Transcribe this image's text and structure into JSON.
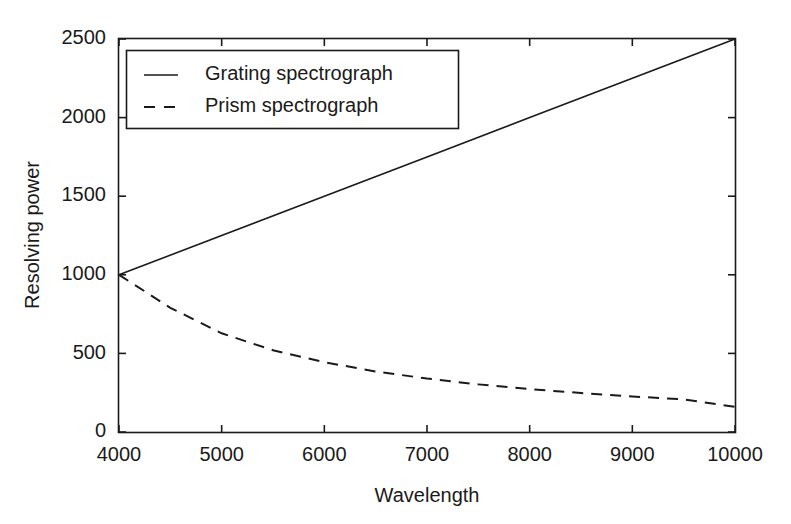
{
  "chart_data": {
    "type": "line",
    "title": "",
    "xlabel": "Wavelength",
    "ylabel": "Resolving power",
    "xlim": [
      4000,
      10000
    ],
    "ylim": [
      0,
      2500
    ],
    "xticks": [
      4000,
      5000,
      6000,
      7000,
      8000,
      9000,
      10000
    ],
    "xtick_labels": [
      "4000",
      "5000",
      "6000",
      "7000",
      "8000",
      "9000",
      "10000"
    ],
    "yticks": [
      0,
      500,
      1000,
      1500,
      2000,
      2500
    ],
    "ytick_labels": [
      "0",
      "500",
      "1000",
      "1500",
      "2000",
      "2500"
    ],
    "grid": false,
    "legend_position": "upper-left-inside",
    "frame": "box-all-sides-inward-ticks",
    "series": [
      {
        "name": "Grating spectrograph",
        "style": "solid",
        "color": "#1a1a1a",
        "x": [
          4000,
          5000,
          6000,
          7000,
          8000,
          9000,
          10000
        ],
        "values": [
          1000,
          1250,
          1500,
          1750,
          2000,
          2250,
          2500
        ]
      },
      {
        "name": "Prism spectrograph",
        "style": "dashed",
        "color": "#1a1a1a",
        "x": [
          4000,
          4500,
          5000,
          5500,
          6000,
          6500,
          7000,
          7500,
          8000,
          8500,
          9000,
          9500,
          10000
        ],
        "values": [
          1000,
          790,
          628,
          520,
          444,
          385,
          340,
          303,
          273,
          248,
          226,
          208,
          160
        ]
      }
    ]
  },
  "legend": {
    "entries": [
      {
        "label": "Grating spectrograph",
        "style": "solid"
      },
      {
        "label": "Prism spectrograph",
        "style": "dashed"
      }
    ]
  },
  "colors": {
    "background": "#ffffff",
    "ink": "#1a1a1a"
  }
}
